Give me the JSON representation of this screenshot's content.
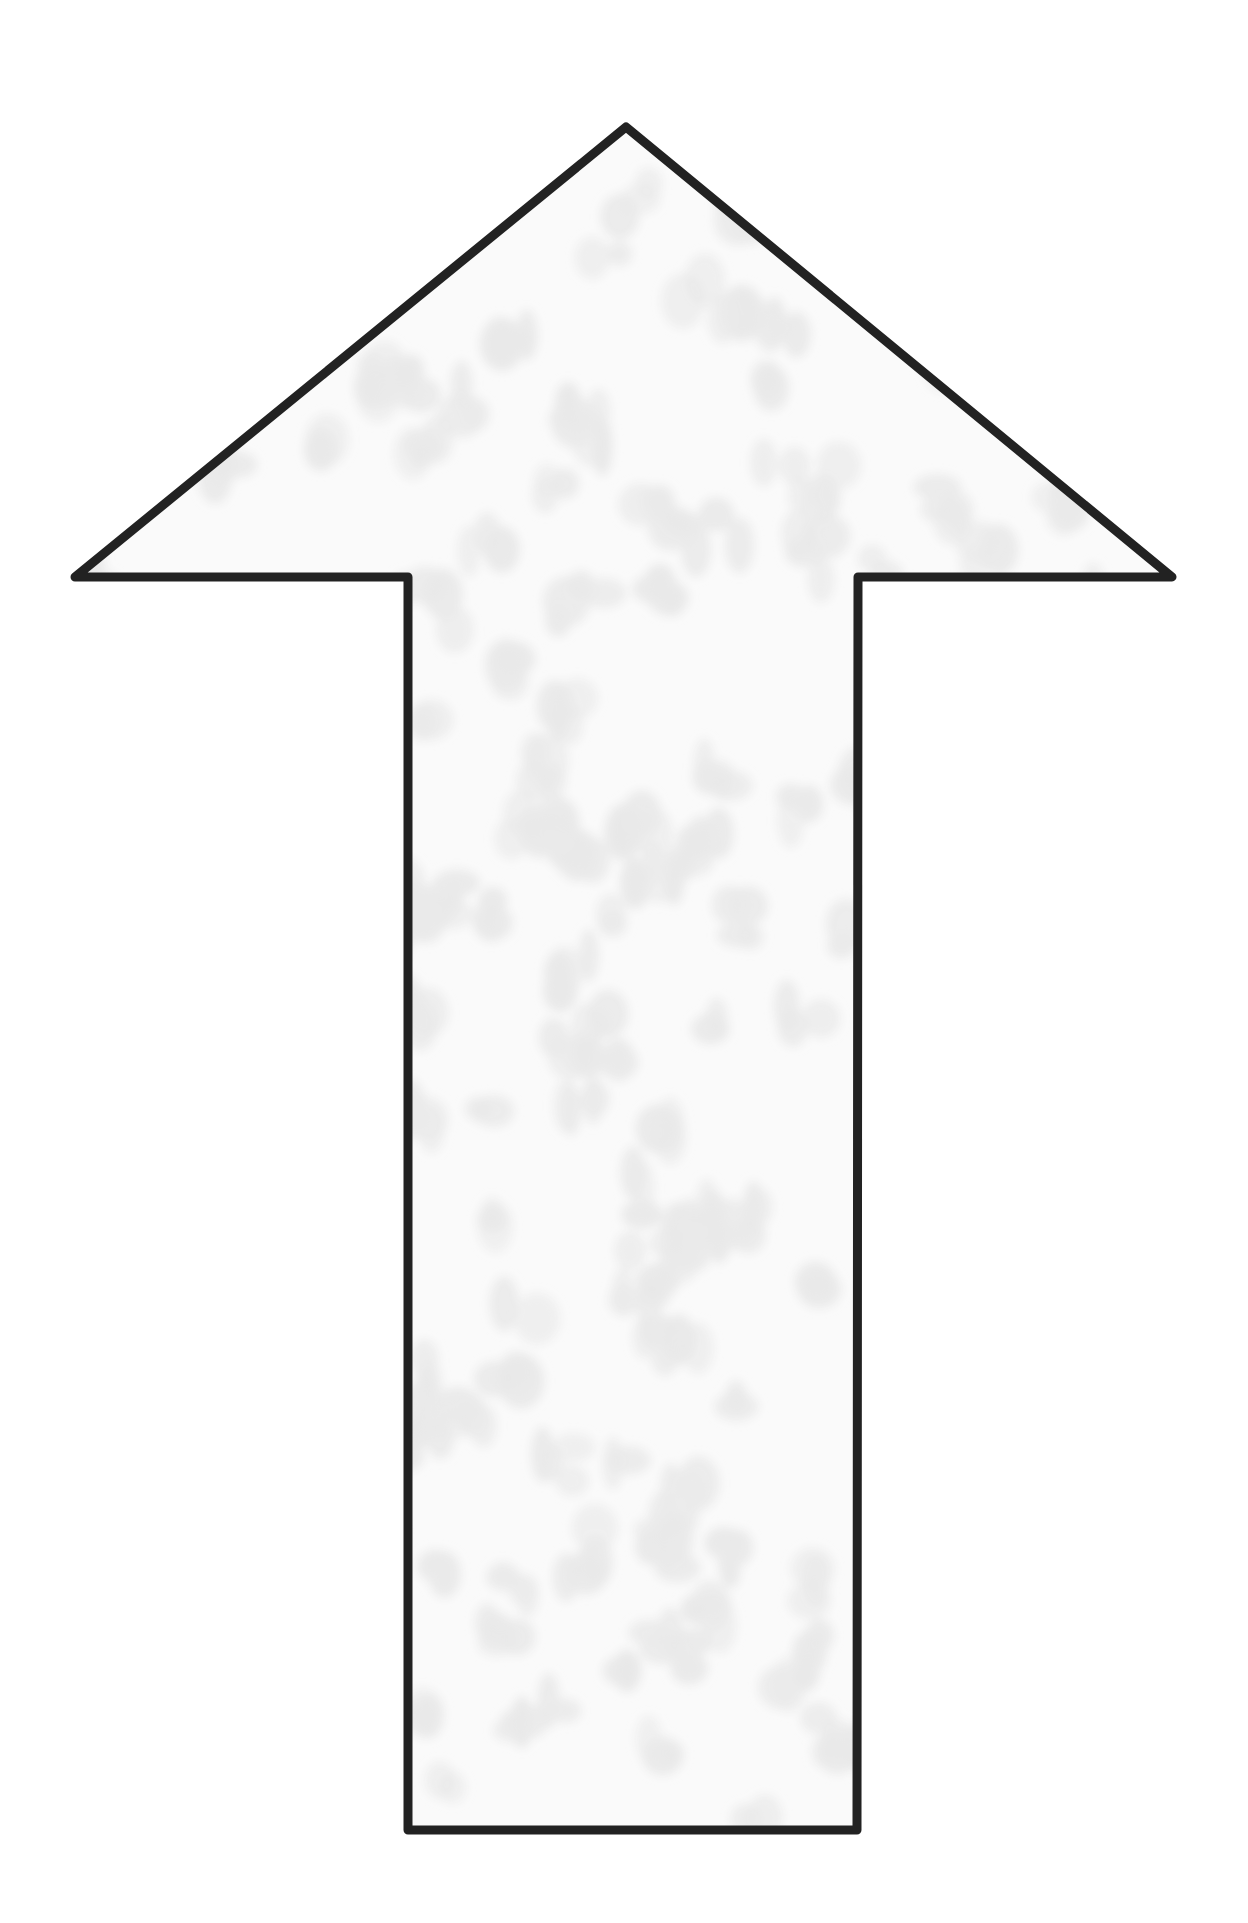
{
  "figure": {
    "shape": "arrow-up",
    "colors": {
      "background": "#ffffff",
      "stroke": "#222222",
      "fill": "#fafafa",
      "spots": "#e9e9e9"
    },
    "stroke_width": 9,
    "points": [
      [
        626,
        127
      ],
      [
        1172,
        577
      ],
      [
        858,
        577
      ],
      [
        857,
        1830
      ],
      [
        408,
        1830
      ],
      [
        408,
        577
      ],
      [
        75,
        577
      ]
    ]
  }
}
